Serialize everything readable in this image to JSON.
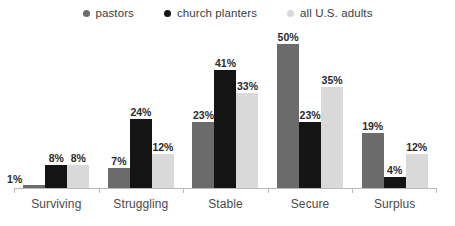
{
  "chart_data": {
    "type": "bar",
    "title": "",
    "subtitle": "",
    "xlabel": "",
    "ylabel": "",
    "ylim": [
      0,
      55
    ],
    "grid": false,
    "legend_position": "top-center",
    "value_suffix": "%",
    "categories": [
      "Surviving",
      "Struggling",
      "Stable",
      "Secure",
      "Surplus"
    ],
    "series": [
      {
        "name": "pastors",
        "color": "#6b6b6b",
        "values": [
          1,
          7,
          23,
          50,
          19
        ],
        "labels": [
          "1%",
          "7%",
          "23%",
          "50%",
          "19%"
        ]
      },
      {
        "name": "church planters",
        "color": "#141414",
        "values": [
          8,
          24,
          41,
          23,
          4
        ],
        "labels": [
          "8%",
          "24%",
          "41%",
          "23%",
          "4%"
        ]
      },
      {
        "name": "all U.S. adults",
        "color": "#d9d9d9",
        "values": [
          8,
          12,
          33,
          35,
          12
        ],
        "labels": [
          "8%",
          "12%",
          "33%",
          "35%",
          "12%"
        ]
      }
    ]
  },
  "axis": {
    "baseline_color": "#b9b9b9",
    "tick_count": 6
  }
}
